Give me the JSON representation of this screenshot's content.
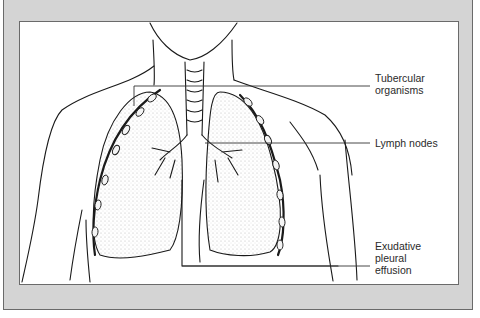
{
  "figure": {
    "labels": [
      {
        "id": "tubercular",
        "text": "Tubercular\norganisms"
      },
      {
        "id": "lymph",
        "text": "Lymph nodes"
      },
      {
        "id": "effusion",
        "text": "Exudative\npleural\neffusion"
      }
    ]
  },
  "colors": {
    "frame": "#d4d4d4",
    "panel": "#ffffff",
    "line": "#1a1a1a",
    "label": "#2a2a2a"
  }
}
